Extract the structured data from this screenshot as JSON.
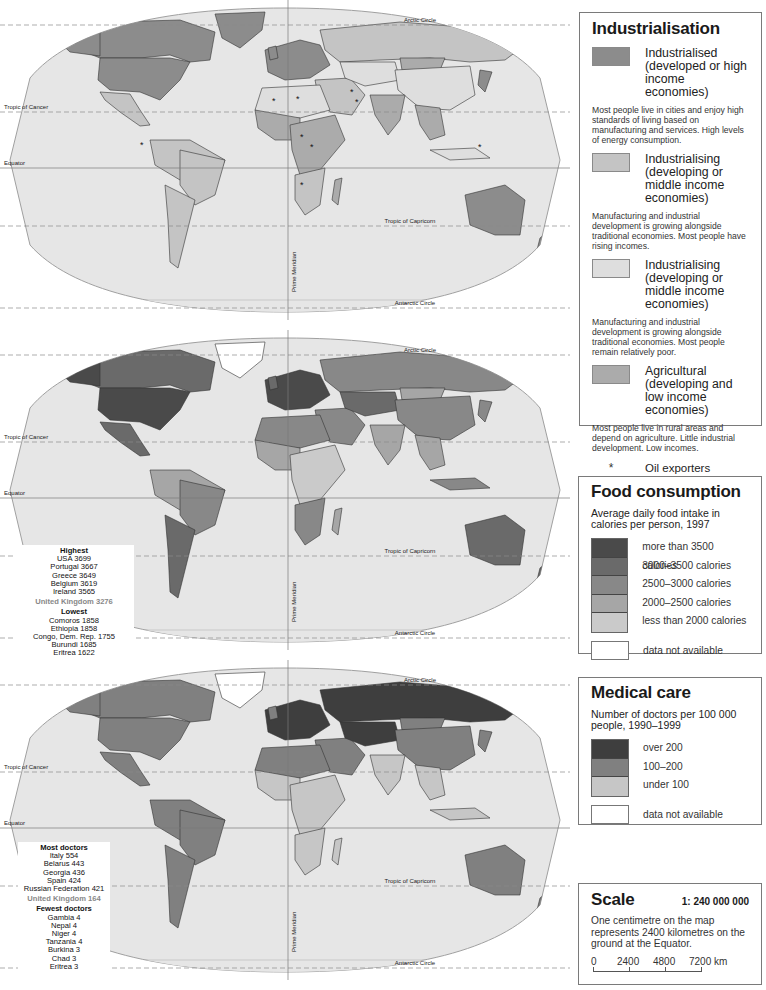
{
  "maps": [
    {
      "id": "industrialisation",
      "labels": {
        "arctic_circle": "Arctic Circle",
        "tropic_of_cancer": "Tropic of Cancer",
        "equator": "Equator",
        "tropic_of_capricorn": "Tropic of Capricorn",
        "antarctic_circle": "Antarctic Circle",
        "prime_meridian": "Prime Meridian"
      }
    },
    {
      "id": "food-consumption",
      "labels": {
        "arctic_circle": "Arctic Circle",
        "tropic_of_cancer": "Tropic of Cancer",
        "equator": "Equator",
        "tropic_of_capricorn": "Tropic of Capricorn",
        "antarctic_circle": "Antarctic Circle",
        "prime_meridian": "Prime Meridian"
      },
      "ranking": {
        "highest_title": "Highest",
        "highest": [
          "USA 3699",
          "Portugal 3667",
          "Greece 3649",
          "Belgium 3619",
          "Ireland 3565"
        ],
        "uk": "United Kingdom 3276",
        "lowest_title": "Lowest",
        "lowest": [
          "Comoros 1858",
          "Ethiopia 1858",
          "Congo, Dem. Rep. 1755",
          "Burundi 1685",
          "Eritrea 1622"
        ]
      }
    },
    {
      "id": "medical-care",
      "labels": {
        "arctic_circle": "Arctic Circle",
        "tropic_of_cancer": "Tropic of Cancer",
        "equator": "Equator",
        "tropic_of_capricorn": "Tropic of Capricorn",
        "antarctic_circle": "Antarctic Circle",
        "prime_meridian": "Prime Meridian"
      },
      "ranking": {
        "highest_title": "Most doctors",
        "highest": [
          "Italy 554",
          "Belarus 443",
          "Georgia 436",
          "Spain 424",
          "Russian Federation 421"
        ],
        "uk": "United Kingdom 164",
        "lowest_title": "Fewest doctors",
        "lowest": [
          "Gambia 4",
          "Nepal 4",
          "Niger 4",
          "Tanzania 4",
          "Burkina 3",
          "Chad 3",
          "Eritrea 3"
        ]
      }
    }
  ],
  "legends": {
    "industrialisation": {
      "title": "Industrialisation",
      "items": [
        {
          "label": "Industrialised (developed or high income economies)",
          "color": "#8c8c8c",
          "desc": "Most people live in cities and enjoy high standards of living based on manufacturing and services. High levels of energy consumption."
        },
        {
          "label": "Industrialising (developing or middle income economies)",
          "color": "#c4c4c4",
          "desc": "Manufacturing and industrial development is growing alongside traditional economies. Most people have rising incomes."
        },
        {
          "label": "Industrialising (developing or middle income economies)",
          "color": "#dedede",
          "desc": "Manufacturing and industrial development is growing alongside traditional economies. Most people remain relatively poor."
        },
        {
          "label": "Agricultural (developing and low income economies)",
          "color": "#ababab",
          "desc": "Most people live in rural areas and depend on agriculture. Little industrial development. Low incomes."
        }
      ],
      "oil": {
        "symbol": "*",
        "label": "Oil exporters",
        "desc": "Countries where export of oil and gas accounts for at least 50% of exports of goods and services."
      }
    },
    "food": {
      "title": "Food consumption",
      "subtitle": "Average daily food intake in calories per person, 1997",
      "classes": [
        {
          "label": "more than 3500 calories",
          "color": "#4a4a4a"
        },
        {
          "label": "3000–3500 calories",
          "color": "#6a6a6a"
        },
        {
          "label": "2500–3000 calories",
          "color": "#888888"
        },
        {
          "label": "2000–2500 calories",
          "color": "#a6a6a6"
        },
        {
          "label": "less than 2000 calories",
          "color": "#cacaca"
        }
      ],
      "na": "data not available"
    },
    "medical": {
      "title": "Medical care",
      "subtitle": "Number of doctors per 100 000 people, 1990–1999",
      "classes": [
        {
          "label": "over 200",
          "color": "#3e3e3e"
        },
        {
          "label": "100–200",
          "color": "#808080"
        },
        {
          "label": "under 100",
          "color": "#c6c6c6"
        }
      ],
      "na": "data not available"
    },
    "scale": {
      "title": "Scale",
      "ratio": "1: 240 000 000",
      "desc": "One centimetre on the map represents 2400 kilometres on the ground at the Equator.",
      "ticks": [
        "0",
        "2400",
        "4800",
        "7200 km"
      ]
    }
  },
  "colors": {
    "ocean": "#e6e6e6",
    "graticule": "#8a8a8a",
    "border": "#333333"
  }
}
